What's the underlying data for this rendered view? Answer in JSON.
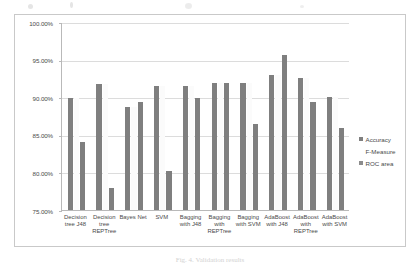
{
  "chart_data": {
    "type": "bar",
    "title": "",
    "xlabel": "",
    "ylabel": "",
    "ylim": [
      75,
      100
    ],
    "ytick_labels": [
      "100.00%",
      "95.00%",
      "90.00%",
      "85.00%",
      "80.00%",
      "75.00%"
    ],
    "ytick_values": [
      100,
      95,
      90,
      85,
      80,
      75
    ],
    "grid": true,
    "legend_position": "right",
    "categories": [
      "Decision tree J48",
      "Decision tree REPTree",
      "Bayes Net",
      "SVM",
      "Bagging with J48",
      "Bagging with REPTree",
      "Bagging with SVM",
      "AdaBoost with J48",
      "AdaBoost with REPTree",
      "AdaBoost with SVM"
    ],
    "series": [
      {
        "name": "Accuracy",
        "color": "#7f7f7f",
        "values": [
          89.9,
          91.7,
          88.7,
          91.5,
          91.5,
          91.9,
          91.9,
          92.9,
          92.5,
          90.0
        ]
      },
      {
        "name": "F-Measure",
        "color": "#fbfbfb",
        "values": [
          89.9,
          91.7,
          88.7,
          91.5,
          91.5,
          91.9,
          91.9,
          92.9,
          92.5,
          90.0
        ]
      },
      {
        "name": "ROC area",
        "color": "#7f7f7f",
        "values": [
          84.0,
          77.9,
          89.4,
          80.2,
          89.9,
          91.9,
          86.5,
          95.6,
          89.4,
          85.9
        ]
      }
    ]
  },
  "legend": {
    "items": [
      {
        "label": "Accuracy",
        "marker": "square-marker"
      },
      {
        "label": "F-Measure",
        "marker": "square-marker"
      },
      {
        "label": "ROC area",
        "marker": "square-marker"
      }
    ]
  },
  "caption": {
    "text": "Fig. 4. Validation results"
  }
}
